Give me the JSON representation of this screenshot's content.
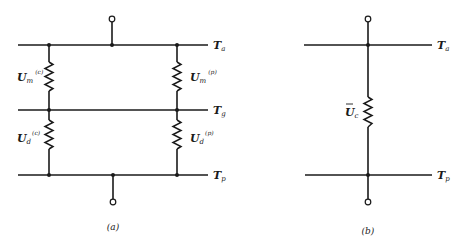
{
  "panel_a": {
    "caption": "(a)",
    "rails": {
      "top": {
        "main": "T",
        "sub": "a"
      },
      "middle": {
        "main": "T",
        "sub": "g"
      },
      "bottom": {
        "main": "T",
        "sub": "p"
      }
    },
    "resistors": {
      "left_upper": {
        "main": "U",
        "sub": "m",
        "sup": "(c)"
      },
      "right_upper": {
        "main": "U",
        "sub": "m",
        "sup": "(p)"
      },
      "left_lower": {
        "main": "U",
        "sub": "d",
        "sup": "(c)"
      },
      "right_lower": {
        "main": "U",
        "sub": "d",
        "sup": "(p)"
      }
    }
  },
  "panel_b": {
    "caption": "(b)",
    "rails": {
      "top": {
        "main": "T",
        "sub": "a"
      },
      "bottom": {
        "main": "T",
        "sub": "p"
      }
    },
    "resistor": {
      "main": "U",
      "sub": "c",
      "overbar": true
    }
  }
}
